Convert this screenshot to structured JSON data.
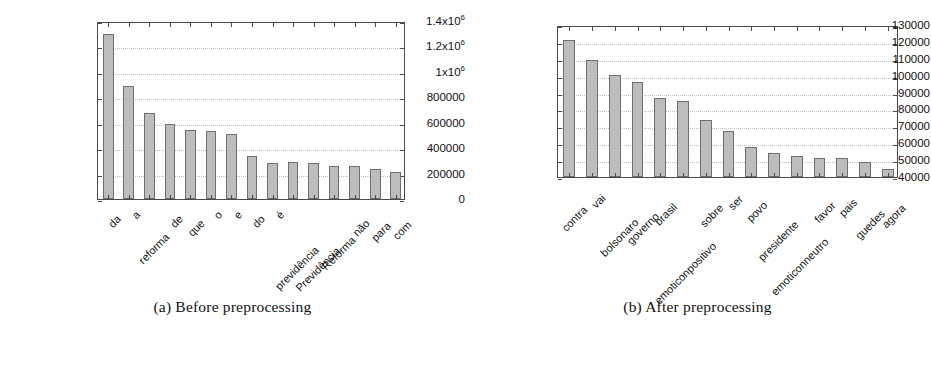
{
  "figure": {
    "subfigures": [
      {
        "caption": "(a) Before preprocessing",
        "caption_label": "(a)",
        "caption_text": "Before preprocessing"
      },
      {
        "caption": "(b) After preprocessing",
        "caption_label": "(b)",
        "caption_text": "After preprocessing"
      }
    ]
  },
  "colors": {
    "bar_fill": "#bdbdbd",
    "bar_stroke": "#6f6f6f",
    "axis": "#4a4a4a",
    "gridline": "#bdbdbd",
    "text": "#111111",
    "background": "#ffffff"
  },
  "chart_data": [
    {
      "type": "bar",
      "title": "(a) Before preprocessing",
      "xlabel": "",
      "ylabel": "",
      "ylim": [
        0,
        1400000
      ],
      "ytick_values": [
        0,
        200000,
        400000,
        600000,
        800000,
        1000000,
        1200000,
        1400000
      ],
      "ytick_labels": [
        "0",
        "200000",
        "400000",
        "600000",
        "800000",
        "1x10^6",
        "1.2x10^6",
        "1.4x10^6"
      ],
      "grid": true,
      "legend": "none",
      "categories": [
        "da",
        "a",
        "reforma",
        "de",
        "que",
        "o",
        "e",
        "do",
        "é",
        "previdência",
        "Previdência",
        "Reforma",
        "não",
        "para",
        "com"
      ],
      "values": [
        1300000,
        890000,
        675000,
        590000,
        540000,
        535000,
        510000,
        335000,
        285000,
        288000,
        285000,
        258000,
        257000,
        240000,
        210000
      ]
    },
    {
      "type": "bar",
      "title": "(b) After preprocessing",
      "xlabel": "",
      "ylabel": "",
      "ylim": [
        40000,
        130000
      ],
      "ytick_values": [
        40000,
        50000,
        60000,
        70000,
        80000,
        90000,
        100000,
        110000,
        120000,
        130000
      ],
      "ytick_labels": [
        "40000",
        "50000",
        "60000",
        "70000",
        "80000",
        "90000",
        "100000",
        "110000",
        "120000",
        "130000"
      ],
      "grid": true,
      "legend": "none",
      "categories": [
        "contra",
        "vai",
        "bolsonaro",
        "governo",
        "brasil",
        "emoticonpositivo",
        "sobre",
        "ser",
        "povo",
        "presidente",
        "emoticonneutro",
        "favor",
        "pais",
        "guedes",
        "agora"
      ],
      "values": [
        121000,
        109500,
        100500,
        96500,
        86500,
        85000,
        74000,
        67000,
        58000,
        54500,
        52500,
        51000,
        51000,
        49000,
        45000
      ]
    }
  ]
}
